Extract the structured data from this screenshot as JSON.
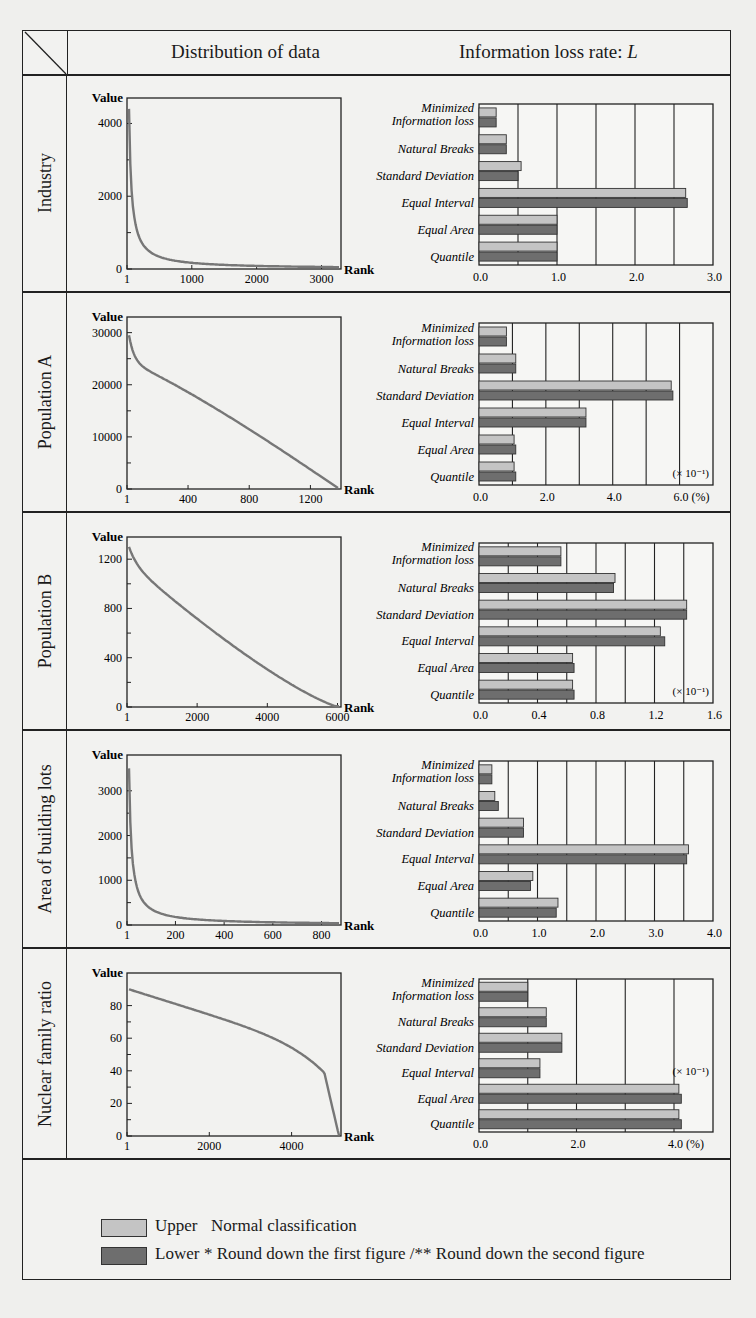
{
  "header": {
    "left_title": "Distribution of data",
    "right_title_prefix": "Information loss rate: ",
    "right_title_var": "L"
  },
  "categories": [
    "Minimized Information loss",
    "Natural Breaks",
    "Standard Deviation",
    "Equal Interval",
    "Equal Area",
    "Quantile"
  ],
  "legend": {
    "upper_label": "Upper",
    "upper_note": "Normal classification",
    "lower_label": "Lower",
    "lower_note": "* Round down the first figure /** Round down the second figure",
    "upper_color": "#c4c4c4",
    "lower_color": "#6e6e6e"
  },
  "chart_data": [
    {
      "row": "Industry",
      "distribution": {
        "type": "line",
        "ylabel": "Value",
        "xlabel": "Rank",
        "yticks": [
          0,
          2000,
          4000
        ],
        "xticks": [
          "1",
          "1000",
          "2000",
          "3000"
        ],
        "ylim": [
          0,
          4700
        ],
        "xlim": [
          1,
          3300
        ],
        "shape": "steep-decay",
        "start_value": 4400
      },
      "loss": {
        "type": "bar",
        "orientation": "horizontal",
        "xticks": [
          "0.0",
          "1.0",
          "2.0",
          "3.0 (%)"
        ],
        "xlim": [
          0,
          3.0
        ],
        "grid_step": 0.5,
        "scale_note": "",
        "series": [
          {
            "name": "Upper",
            "values": [
              0.22,
              0.35,
              0.54,
              2.65,
              1.0,
              1.0
            ]
          },
          {
            "name": "Lower",
            "values": [
              0.22,
              0.35,
              0.5,
              2.67,
              1.0,
              1.0
            ]
          }
        ]
      }
    },
    {
      "row": "Population A",
      "distribution": {
        "type": "line",
        "ylabel": "Value",
        "xlabel": "Rank",
        "yticks": [
          0,
          10000,
          20000,
          30000
        ],
        "xticks": [
          "1",
          "400",
          "800",
          "1200"
        ],
        "ylim": [
          0,
          33000
        ],
        "xlim": [
          1,
          1400
        ],
        "shape": "concave-decline",
        "start_value": 29500
      },
      "loss": {
        "type": "bar",
        "orientation": "horizontal",
        "xticks": [
          "0.0",
          "2.0",
          "4.0",
          "6.0 (%)"
        ],
        "xlim": [
          0,
          7.0
        ],
        "grid_step": 1.0,
        "scale_note": "(× 10⁻¹)",
        "series": [
          {
            "name": "Upper",
            "values": [
              0.82,
              1.1,
              5.75,
              3.2,
              1.05,
              1.05
            ]
          },
          {
            "name": "Lower",
            "values": [
              0.82,
              1.1,
              5.8,
              3.2,
              1.1,
              1.1
            ]
          }
        ]
      }
    },
    {
      "row": "Population B",
      "distribution": {
        "type": "line",
        "ylabel": "Value",
        "xlabel": "Rank",
        "yticks": [
          0,
          400,
          800,
          1200
        ],
        "xticks": [
          "1",
          "2000",
          "4000",
          "6000"
        ],
        "ylim": [
          0,
          1380
        ],
        "xlim": [
          1,
          6100
        ],
        "shape": "near-linear-decline",
        "start_value": 1300
      },
      "loss": {
        "type": "bar",
        "orientation": "horizontal",
        "xticks": [
          "0.0",
          "0.4",
          "0.8",
          "1.2",
          "1.6 (%)"
        ],
        "xlim": [
          0,
          1.6
        ],
        "grid_step": 0.2,
        "scale_note": "(× 10⁻¹)",
        "series": [
          {
            "name": "Upper",
            "values": [
              0.56,
              0.93,
              1.42,
              1.24,
              0.64,
              0.64
            ]
          },
          {
            "name": "Lower",
            "values": [
              0.56,
              0.92,
              1.42,
              1.27,
              0.65,
              0.65
            ]
          }
        ]
      }
    },
    {
      "row": "Area of building lots",
      "distribution": {
        "type": "line",
        "ylabel": "Value",
        "xlabel": "Rank",
        "yticks": [
          0,
          1000,
          2000,
          3000
        ],
        "xticks": [
          "1",
          "200",
          "400",
          "600",
          "800"
        ],
        "ylim": [
          0,
          3800
        ],
        "xlim": [
          1,
          880
        ],
        "shape": "steep-decay",
        "start_value": 3500
      },
      "loss": {
        "type": "bar",
        "orientation": "horizontal",
        "xticks": [
          "0.0",
          "1.0",
          "2.0",
          "3.0",
          "4.0 (%)"
        ],
        "xlim": [
          0,
          4.0
        ],
        "grid_step": 0.5,
        "scale_note": "",
        "series": [
          {
            "name": "Upper",
            "values": [
              0.22,
              0.27,
              0.76,
              3.58,
              0.92,
              1.35
            ]
          },
          {
            "name": "Lower",
            "values": [
              0.22,
              0.33,
              0.76,
              3.55,
              0.88,
              1.32
            ]
          }
        ]
      }
    },
    {
      "row": "Nuclear family ratio",
      "distribution": {
        "type": "line",
        "ylabel": "Value",
        "xlabel": "Rank",
        "yticks": [
          0,
          20,
          40,
          60,
          80
        ],
        "xticks": [
          "1",
          "2000",
          "4000"
        ],
        "ylim": [
          0,
          100
        ],
        "xlim": [
          1,
          5200
        ],
        "shape": "convex-drop",
        "start_value": 90
      },
      "loss": {
        "type": "bar",
        "orientation": "horizontal",
        "xticks": [
          "0.0",
          "2.0",
          "4.0 (%)"
        ],
        "xlim": [
          0,
          4.8
        ],
        "grid_step": 1.0,
        "scale_note": "(× 10⁻¹)",
        "series": [
          {
            "name": "Upper",
            "values": [
              1.0,
              1.38,
              1.7,
              1.25,
              4.1,
              4.1
            ]
          },
          {
            "name": "Lower",
            "values": [
              1.0,
              1.38,
              1.7,
              1.25,
              4.15,
              4.15
            ]
          }
        ]
      }
    }
  ]
}
